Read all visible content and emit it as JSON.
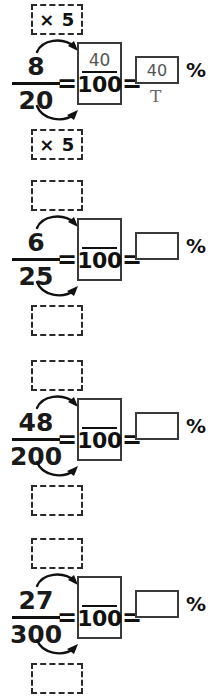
{
  "worksheet": {
    "title_fragment_cut_off_top": "",
    "percent_symbol": "%",
    "equals_symbol": "=",
    "hundred_denominator": "100",
    "problems": [
      {
        "id": "problem-1",
        "numerator": "8",
        "denominator": "20",
        "multiplier_top": "× 5",
        "multiplier_bottom": "× 5",
        "hundred_numerator": "40",
        "answer": "40",
        "hand_annotation": "T",
        "filled": true
      },
      {
        "id": "problem-2",
        "numerator": "6",
        "denominator": "25",
        "multiplier_top": "",
        "multiplier_bottom": "",
        "hundred_numerator": "",
        "answer": "",
        "hand_annotation": "",
        "filled": false
      },
      {
        "id": "problem-3",
        "numerator": "48",
        "denominator": "200",
        "multiplier_top": "",
        "multiplier_bottom": "",
        "hundred_numerator": "",
        "answer": "",
        "hand_annotation": "",
        "filled": false
      },
      {
        "id": "problem-4",
        "numerator": "27",
        "denominator": "300",
        "multiplier_top": "",
        "multiplier_bottom": "",
        "hundred_numerator": "",
        "answer": "",
        "hand_annotation": "",
        "filled": false
      }
    ]
  },
  "colors": {
    "ink": "#111111",
    "box_stroke": "#3a3a3a",
    "dashed_stroke": "#2a2a2a",
    "handwriting": "#555555",
    "paper": "#ffffff"
  },
  "layout": {
    "problem_tops": [
      4,
      180,
      360,
      538
    ]
  }
}
